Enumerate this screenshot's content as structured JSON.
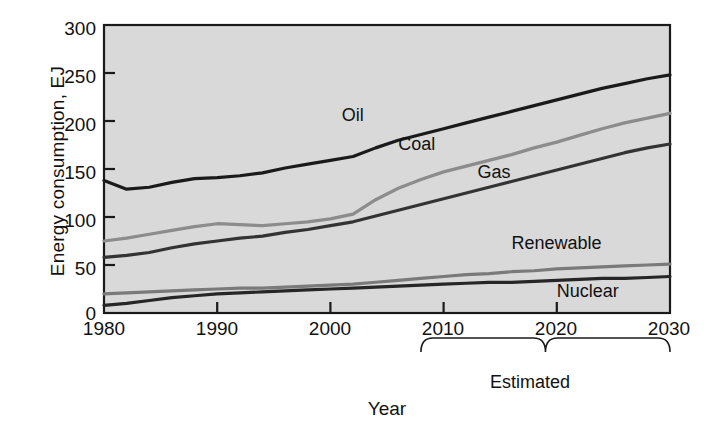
{
  "chart_data": {
    "type": "line",
    "title": "",
    "xlabel": "Year",
    "ylabel": "Energy consumption, EJ",
    "xlim": [
      1980,
      2030
    ],
    "ylim": [
      0,
      300
    ],
    "xticks": [
      1980,
      1990,
      2000,
      2010,
      2020,
      2030
    ],
    "yticks": [
      0,
      50,
      100,
      150,
      200,
      250,
      300
    ],
    "grid": false,
    "legend_position": "inline-labels",
    "plot_background": "#d9d9d9",
    "annotations": [
      {
        "text": "Estimated",
        "x_start": 2008,
        "x_end": 2030,
        "type": "brace"
      }
    ],
    "x": [
      1980,
      1982,
      1984,
      1986,
      1988,
      1990,
      1992,
      1994,
      1996,
      1998,
      2000,
      2002,
      2004,
      2006,
      2008,
      2010,
      2012,
      2014,
      2016,
      2018,
      2020,
      2022,
      2024,
      2026,
      2028,
      2030
    ],
    "series": [
      {
        "name": "Oil",
        "color": "#1a1a1a",
        "label_x": 2001,
        "label_y": 205,
        "values": [
          138,
          129,
          131,
          136,
          140,
          141,
          143,
          146,
          151,
          155,
          159,
          163,
          172,
          180,
          186,
          192,
          198,
          204,
          210,
          216,
          222,
          228,
          234,
          239,
          244,
          248
        ]
      },
      {
        "name": "Coal",
        "color": "#8c8c8c",
        "label_x": 2006,
        "label_y": 175,
        "values": [
          75,
          78,
          82,
          86,
          90,
          93,
          92,
          91,
          93,
          95,
          98,
          103,
          118,
          130,
          139,
          147,
          153,
          159,
          165,
          172,
          178,
          185,
          192,
          198,
          203,
          208
        ]
      },
      {
        "name": "Gas",
        "color": "#333333",
        "label_x": 2013,
        "label_y": 146,
        "values": [
          58,
          60,
          63,
          68,
          72,
          75,
          78,
          80,
          84,
          87,
          91,
          95,
          101,
          107,
          113,
          119,
          125,
          131,
          137,
          143,
          149,
          155,
          161,
          167,
          172,
          176
        ]
      },
      {
        "name": "Renewable",
        "color": "#7a7a7a",
        "label_x": 2016,
        "label_y": 72,
        "values": [
          20,
          21,
          22,
          23,
          24,
          25,
          26,
          26,
          27,
          28,
          29,
          30,
          32,
          34,
          36,
          38,
          40,
          41,
          43,
          44,
          46,
          47,
          48,
          49,
          50,
          51
        ]
      },
      {
        "name": "Nuclear",
        "color": "#262626",
        "label_x": 2020,
        "label_y": 22,
        "values": [
          8,
          10,
          13,
          16,
          18,
          20,
          21,
          22,
          23,
          24,
          25,
          26,
          27,
          28,
          29,
          30,
          31,
          32,
          32,
          33,
          34,
          35,
          36,
          36,
          37,
          38
        ]
      }
    ]
  },
  "axis": {
    "y_tick_labels": [
      "300",
      "250",
      "200",
      "150",
      "100",
      "50",
      "0"
    ],
    "x_tick_labels": [
      "1980",
      "1990",
      "2000",
      "2010",
      "2020",
      "2030"
    ],
    "y_axis_title": "Energy consumption, EJ",
    "x_axis_title": "Year"
  },
  "labels": {
    "oil": "Oil",
    "coal": "Coal",
    "gas": "Gas",
    "renewable": "Renewable",
    "nuclear": "Nuclear",
    "estimated": "Estimated"
  }
}
